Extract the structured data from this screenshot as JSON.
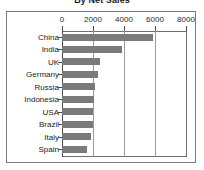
{
  "chart_data": {
    "type": "bar",
    "orientation": "horizontal",
    "title": "By Net Sales",
    "xlabel": "",
    "ylabel": "",
    "xlim": [
      0,
      8000
    ],
    "xticks": [
      0,
      2000,
      4000,
      6000,
      8000
    ],
    "xtick_labels": [
      "0",
      "2000",
      "4000",
      "6000",
      "8000"
    ],
    "grid": true,
    "grid_axis": "x",
    "legend": false,
    "bar_color": "#7a7a7a",
    "categories": [
      "China",
      "India",
      "UK",
      "Germany",
      "Russia",
      "Indonesia",
      "USA",
      "Brazil",
      "Italy",
      "Spain"
    ],
    "values": [
      5850,
      3850,
      2450,
      2350,
      2150,
      2050,
      2000,
      2000,
      1900,
      1600
    ]
  },
  "figure": {
    "title": "By Net Sales",
    "frame_color": "#7d7d7d",
    "background": "#ffffff"
  }
}
